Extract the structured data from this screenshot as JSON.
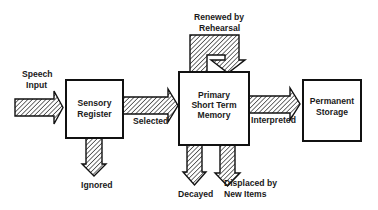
{
  "diagram": {
    "type": "memory-model-flowchart",
    "nodes": {
      "sensory_register": {
        "line1": "Sensory",
        "line2": "Register"
      },
      "primary_stm": {
        "line1": "Primary",
        "line2": "Short Term",
        "line3": "Memory"
      },
      "permanent_storage": {
        "line1": "Permanent",
        "line2": "Storage"
      }
    },
    "edges": {
      "speech_input": {
        "line1": "Speech",
        "line2": "Input"
      },
      "selected": {
        "label": "Selected"
      },
      "interpreted": {
        "label": "Interpreted"
      },
      "rehearsal": {
        "line1": "Renewed by",
        "line2": "Rehearsal"
      },
      "ignored": {
        "label": "Ignored"
      },
      "decayed": {
        "label": "Decayed"
      },
      "displaced": {
        "line1": "Displaced by",
        "line2": "New Items"
      }
    },
    "colors": {
      "stroke": "#111111",
      "background": "#ffffff",
      "text": "#1a1a1a"
    }
  }
}
